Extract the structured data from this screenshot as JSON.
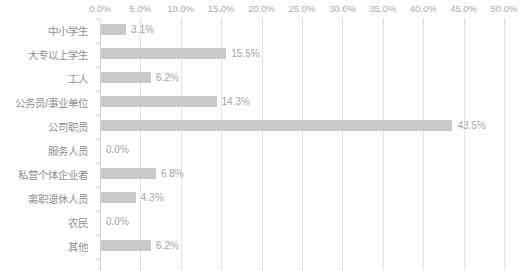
{
  "chart_data": {
    "type": "bar",
    "orientation": "horizontal",
    "title": "",
    "xlabel": "",
    "ylabel": "",
    "xlim": [
      0,
      50
    ],
    "grid": true,
    "legend": false,
    "value_suffix": "%",
    "axis_ticks": [
      "0.0%",
      "5.0%",
      "10.0%",
      "15.0%",
      "20.0%",
      "25.0%",
      "30.0%",
      "35.0%",
      "40.0%",
      "45.0%",
      "50.0%"
    ],
    "axis_tick_values": [
      0,
      5,
      10,
      15,
      20,
      25,
      30,
      35,
      40,
      45,
      50
    ],
    "categories": [
      "中小学生",
      "大专以上学生",
      "工人",
      "公务员/事业单位",
      "公司职员",
      "服务人员",
      "私营个体企业者",
      "离职退休人员",
      "农民",
      "其他"
    ],
    "values": [
      3.1,
      15.5,
      6.2,
      14.3,
      43.5,
      0.0,
      6.8,
      4.3,
      0.0,
      6.2
    ],
    "value_labels": [
      "3.1%",
      "15.5%",
      "6.2%",
      "14.3%",
      "43.5%",
      "0.0%",
      "6.8%",
      "4.3%",
      "0.0%",
      "6.2%"
    ]
  },
  "colors": {
    "bar": "#c9c9c9",
    "gridline": "#e4e4e4",
    "axis": "#d2d2d2",
    "tick_text": "#a9a9a9",
    "category_text": "#909090",
    "value_text": "#a4a4a4",
    "background": "#ffffff"
  }
}
